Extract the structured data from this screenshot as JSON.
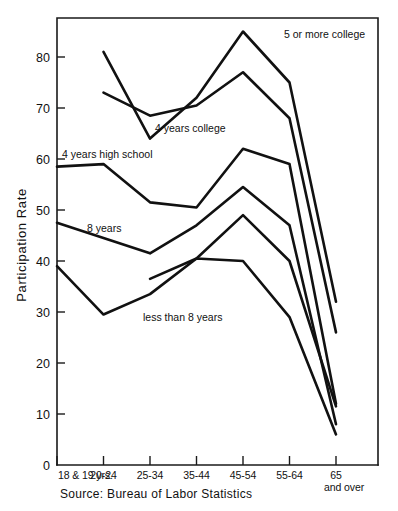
{
  "chart_data": {
    "type": "line",
    "title": "",
    "xlabel": "",
    "ylabel": "Participation Rate",
    "ylim": [
      0,
      88
    ],
    "yticks": [
      0,
      10,
      20,
      30,
      40,
      50,
      60,
      70,
      80
    ],
    "ytick_labels": [
      "0",
      "10",
      "20",
      "30",
      "40",
      "50",
      "60",
      "70",
      "80"
    ],
    "grid": false,
    "legend_position": "inline-labels",
    "categories": [
      "18 & 19 yrs.",
      "20-24",
      "25-34",
      "35-44",
      "45-54",
      "55-64",
      "65 and over"
    ],
    "series": [
      {
        "name": "5 or more college",
        "label": "5 or more college",
        "values": [
          null,
          81,
          64,
          72,
          85,
          75,
          32
        ]
      },
      {
        "name": "4 years college",
        "label": "4 years college",
        "values": [
          null,
          73,
          68.5,
          70.5,
          77,
          68,
          26
        ]
      },
      {
        "name": "4 years high school",
        "label": "4 years high school",
        "values": [
          58.5,
          59,
          51.5,
          50.5,
          62,
          59,
          12
        ]
      },
      {
        "name": "8 years",
        "label": "8 years",
        "values": [
          47.5,
          null,
          41.5,
          47,
          54.5,
          47,
          8
        ]
      },
      {
        "name": "mid series",
        "label": "",
        "values": [
          null,
          null,
          36.5,
          40.5,
          49,
          40,
          11.5
        ]
      },
      {
        "name": "less than 8 years",
        "label": "less than 8 years",
        "values": [
          39,
          29.5,
          33.5,
          40.5,
          40,
          29,
          6
        ]
      }
    ],
    "annotations": [
      {
        "text": "5 or more college",
        "x": 284,
        "y": 38,
        "anchor": "start"
      },
      {
        "text": "4 years college",
        "x": 155,
        "y": 132,
        "anchor": "start"
      },
      {
        "text": "4 years high school",
        "x": 62,
        "y": 158,
        "anchor": "start"
      },
      {
        "text": "8 years",
        "x": 87,
        "y": 232,
        "anchor": "start"
      },
      {
        "text": "less than 8 years",
        "x": 143,
        "y": 321,
        "anchor": "start"
      }
    ],
    "source": "Source: Bureau of Labor Statistics"
  }
}
